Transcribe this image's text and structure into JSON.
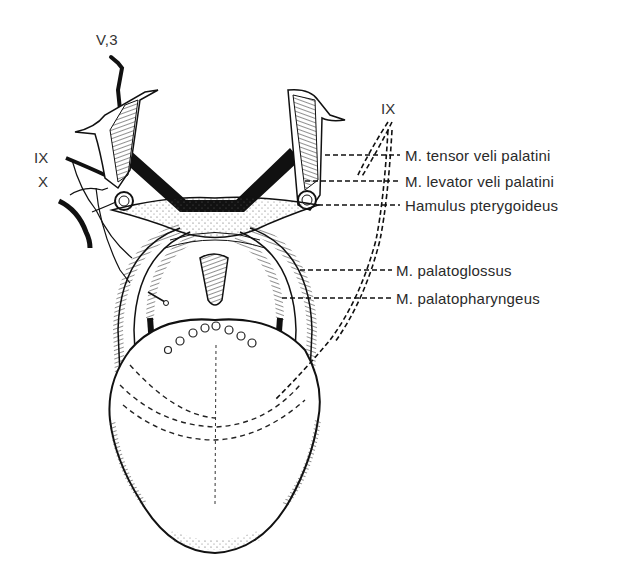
{
  "figure": {
    "nerve_labels": {
      "v3": "V,3",
      "ix_left": "IX",
      "x_left": "X",
      "ix_right": "IX"
    },
    "structure_labels": [
      {
        "id": "tensor",
        "text": "M. tensor veli palatini"
      },
      {
        "id": "levator",
        "text": "M. levator veli palatini"
      },
      {
        "id": "hamulus",
        "text": "Hamulus pterygoideus"
      },
      {
        "id": "palatoglossus",
        "text": "M. palatoglossus"
      },
      {
        "id": "palatopharyngeus",
        "text": "M. palatopharyngeus"
      }
    ],
    "colors": {
      "ink": "#111111",
      "label": "#2a2a2a",
      "background": "#ffffff"
    }
  }
}
